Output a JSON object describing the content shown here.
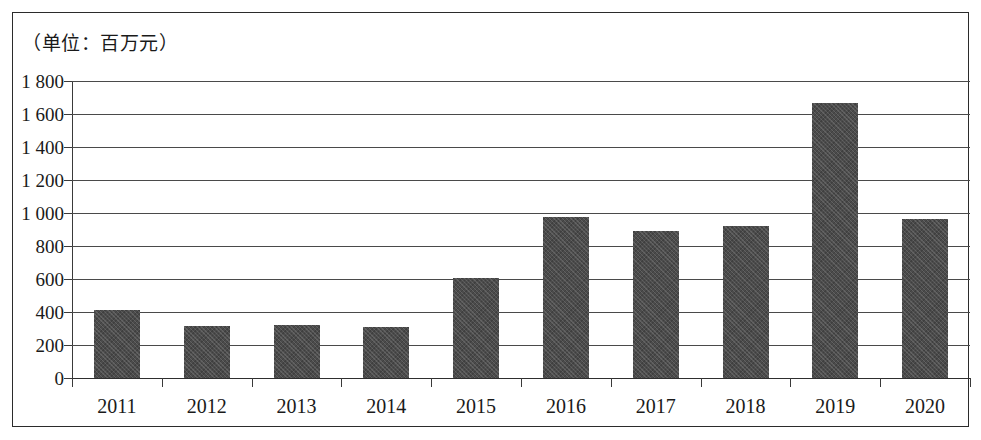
{
  "figure": {
    "unit_label": "（单位：百万元）"
  },
  "chart_data": {
    "type": "bar",
    "title": "",
    "subtitle": "",
    "unit_note": "（单位：百万元）",
    "xlabel": "",
    "ylabel": "",
    "categories": [
      "2011",
      "2012",
      "2013",
      "2014",
      "2015",
      "2016",
      "2017",
      "2018",
      "2019",
      "2020"
    ],
    "values": [
      410,
      315,
      320,
      312,
      605,
      978,
      892,
      920,
      1668,
      963
    ],
    "series": [
      {
        "name": "金额",
        "values": [
          410,
          315,
          320,
          312,
          605,
          978,
          892,
          920,
          1668,
          963
        ]
      }
    ],
    "ylim": [
      0,
      1800
    ],
    "ytick_values": [
      0,
      200,
      400,
      600,
      800,
      1000,
      1200,
      1400,
      1600,
      1800
    ],
    "ytick_labels": [
      "0",
      "200",
      "400",
      "600",
      "800",
      "1 000",
      "1 200",
      "1 400",
      "1 600",
      "1 800"
    ],
    "grid": true,
    "grid_axis": "y",
    "legend": false,
    "legend_position": "none",
    "bar_color": "#4b4b4b",
    "axis_color": "#3a3a3a",
    "background_color": "#ffffff",
    "annotations": []
  }
}
